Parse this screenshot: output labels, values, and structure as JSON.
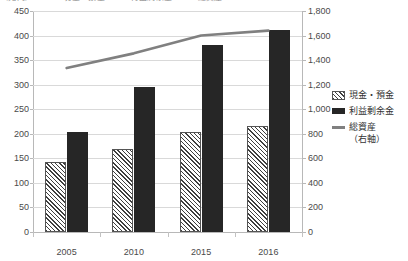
{
  "title_strip": "（兆円）　　　　現金・預金　　　利益剰余金　　　総資産",
  "chart_data": {
    "type": "bar",
    "title": "",
    "subtitle": "",
    "xlabel": "",
    "ylabel": "",
    "categories": [
      "2005",
      "2010",
      "2015",
      "2016"
    ],
    "grid": true,
    "legend_position": "right",
    "axes": {
      "left": {
        "label": "",
        "min": 0,
        "max": 450,
        "step": 50,
        "ticks": [
          "0",
          "50",
          "100",
          "150",
          "200",
          "250",
          "300",
          "350",
          "400",
          "450"
        ]
      },
      "right": {
        "label": "（右軸）",
        "min": 0,
        "max": 1800,
        "step": 200,
        "ticks": [
          "0",
          "200",
          "400",
          "600",
          "800",
          "1,000",
          "1,200",
          "1,400",
          "1,600",
          "1,800"
        ]
      }
    },
    "series": [
      {
        "name": "現金・預金",
        "type": "bar",
        "style": "hatched",
        "axis": "left",
        "color": "#3f3f3f",
        "values": [
          143,
          170,
          203,
          215
        ]
      },
      {
        "name": "利益剰余金",
        "type": "bar",
        "style": "solid",
        "axis": "left",
        "color": "#262626",
        "values": [
          204,
          296,
          381,
          411
        ]
      },
      {
        "name": "総資産",
        "type": "line",
        "style": "line",
        "axis": "right",
        "color": "#808080",
        "values": [
          1335,
          1455,
          1600,
          1640
        ]
      }
    ]
  },
  "legend": {
    "items": [
      {
        "label": "現金・預金",
        "key": "hatch"
      },
      {
        "label": "利益剰余金",
        "key": "solid"
      },
      {
        "label": "総資産",
        "key": "line",
        "sublabel": "（右軸）"
      }
    ]
  }
}
